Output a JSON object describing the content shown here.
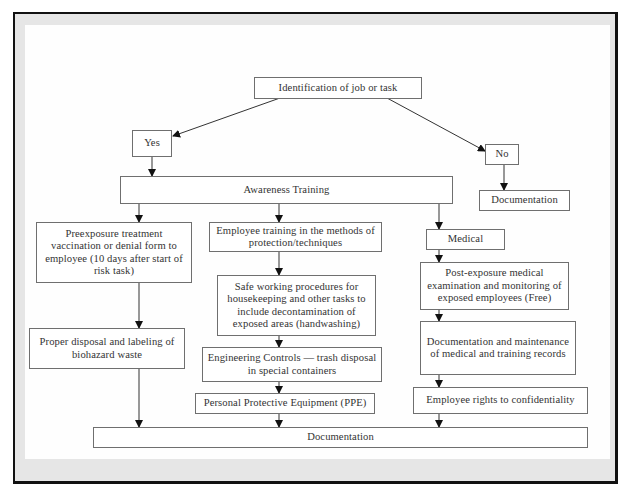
{
  "diagram": {
    "type": "flowchart",
    "nodes": {
      "identification": "Identification of job or task",
      "yes": "Yes",
      "no": "No",
      "documentation_no": "Documentation",
      "awareness_training": "Awareness Training",
      "preexposure": "Preexposure treatment vaccination or denial form to employee (10 days after start of risk task)",
      "proper_disposal": "Proper disposal and labeling of biohazard waste",
      "employee_training": "Employee training in the methods of protection/techniques",
      "safe_working": "Safe working procedures for housekeeping and other tasks to include decontamination of exposed areas (handwashing)",
      "engineering_controls": "Engineering Controls — trash disposal in special containers",
      "ppe": "Personal Protective Equipment (PPE)",
      "medical": "Medical",
      "post_exposure": "Post-exposure medical examination and monitoring of exposed employees (Free)",
      "documentation_maintenance": "Documentation and maintenance of medical and training records",
      "employee_rights": "Employee rights to confidentiality",
      "documentation_final": "Documentation"
    },
    "edges": [
      [
        "identification",
        "yes"
      ],
      [
        "identification",
        "no"
      ],
      [
        "no",
        "documentation_no"
      ],
      [
        "yes",
        "awareness_training"
      ],
      [
        "awareness_training",
        "preexposure"
      ],
      [
        "awareness_training",
        "employee_training"
      ],
      [
        "awareness_training",
        "medical"
      ],
      [
        "preexposure",
        "proper_disposal"
      ],
      [
        "proper_disposal",
        "documentation_final"
      ],
      [
        "employee_training",
        "safe_working"
      ],
      [
        "safe_working",
        "engineering_controls"
      ],
      [
        "engineering_controls",
        "ppe"
      ],
      [
        "ppe",
        "documentation_final"
      ],
      [
        "medical",
        "post_exposure"
      ],
      [
        "post_exposure",
        "documentation_maintenance"
      ],
      [
        "documentation_maintenance",
        "employee_rights"
      ],
      [
        "employee_rights",
        "documentation_final"
      ]
    ]
  }
}
